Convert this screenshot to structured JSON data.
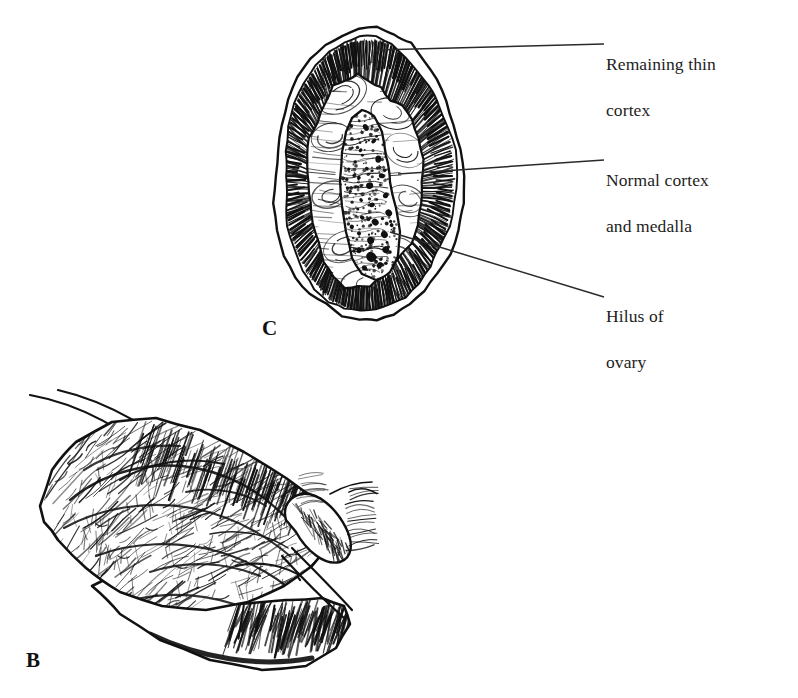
{
  "figure": {
    "background_color": "#ffffff",
    "ink_color": "#1a1a1a",
    "panels": [
      {
        "id": "C",
        "letter": "C",
        "caption": "Cross-section of ovary showing cortex, medulla and hilus"
      },
      {
        "id": "B",
        "letter": "B",
        "caption": "Three-dimensional view of ovary with tube"
      }
    ],
    "labels": [
      {
        "id": "remaining-thin-cortex",
        "text": "Remaining thin\ncortex",
        "line1": "Remaining thin",
        "line2": "cortex",
        "x": 606,
        "y": 30,
        "leader": {
          "x1": 376,
          "y1": 50,
          "x2": 604,
          "y2": 44
        }
      },
      {
        "id": "normal-cortex-and-medalla",
        "text": "Normal cortex\nand medalla",
        "line1": "Normal cortex",
        "line2": "and medalla",
        "x": 606,
        "y": 146,
        "leader": {
          "x1": 398,
          "y1": 174,
          "x2": 604,
          "y2": 160
        }
      },
      {
        "id": "hilus-of-ovary",
        "text": "Hilus of\novary",
        "line1": "Hilus of",
        "line2": "ovary",
        "x": 606,
        "y": 282,
        "leader": {
          "x1": 390,
          "y1": 232,
          "x2": 604,
          "y2": 297
        }
      }
    ],
    "panel_letter_c": {
      "label": "C",
      "x": 262,
      "y": 316
    },
    "panel_letter_b": {
      "label": "B",
      "x": 26,
      "y": 648
    }
  }
}
